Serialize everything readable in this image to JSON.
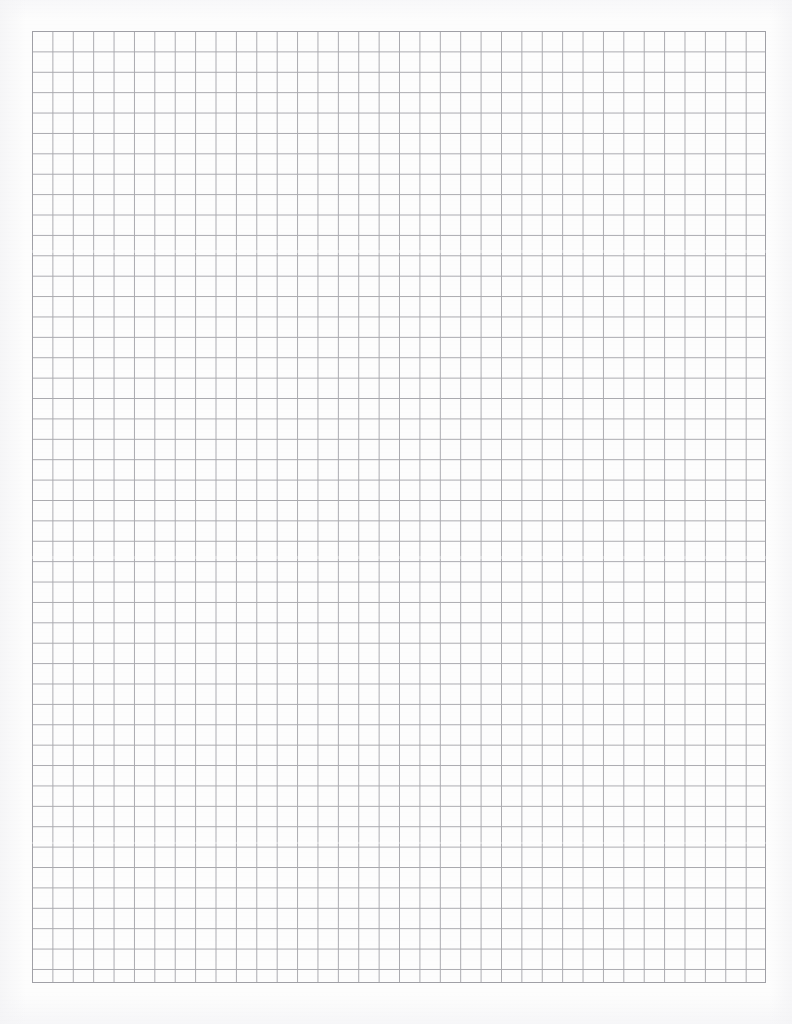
{
  "document": {
    "type": "graph-paper-scan",
    "title": "Blank Quadrille Graph Paper",
    "page_width_px": 792,
    "page_height_px": 1024,
    "paper_color": "#fdfdfd",
    "page_background": "#ffffff",
    "has_text": false,
    "has_handwriting": false,
    "notes": "Scanned blank sheet of square-ruled graph paper; no printed labels, headers, margins rules or markings are visible."
  },
  "grid": {
    "description": "Uniform square quadrille grid",
    "line_color": "#a9a9ae",
    "line_width_px": 1,
    "cell_size_px": 20.4,
    "columns": 36,
    "rows": 47,
    "left_px": 32,
    "top_px": 31,
    "right_px": 766,
    "bottom_px": 983,
    "width_px": 734,
    "height_px": 952,
    "major_lines": false,
    "major_every": 0,
    "border_color": "#a0a0a6"
  },
  "margins": {
    "left_px": 32,
    "top_px": 31,
    "right_px": 26,
    "bottom_px": 41,
    "color": "#ffffff"
  }
}
